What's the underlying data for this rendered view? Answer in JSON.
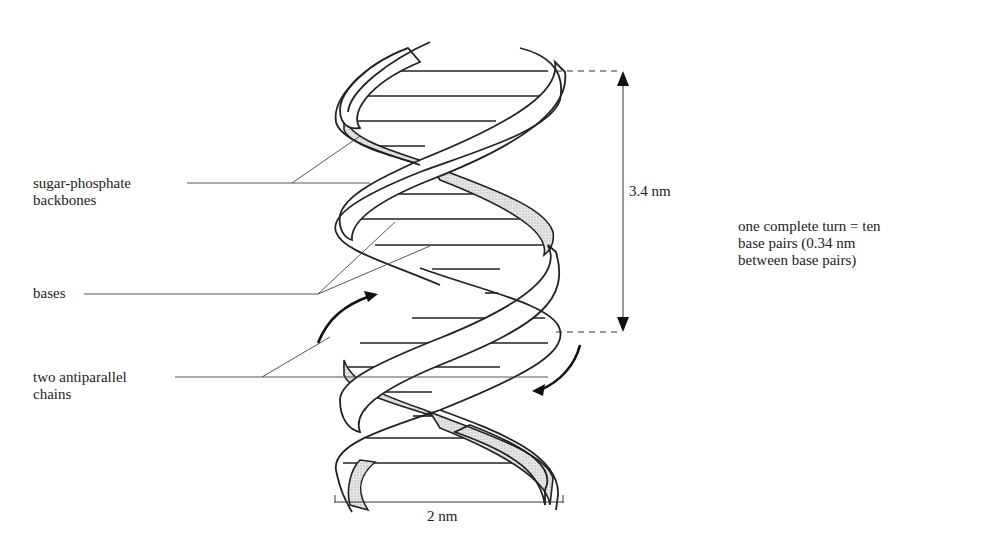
{
  "diagram": {
    "labels": {
      "backbones": "sugar-phosphate\nbackbones",
      "bases": "bases",
      "chains": "two antiparallel\nchains",
      "pitch": "3.4 nm",
      "turn_note": "one complete turn = ten\nbase pairs (0.34 nm\nbetween base pairs)",
      "width": "2 nm"
    },
    "measurements": {
      "helix_pitch_nm": 3.4,
      "helix_diameter_nm": 2,
      "base_pairs_per_turn": 10,
      "base_pair_spacing_nm": 0.34
    },
    "colors": {
      "line": "#222222",
      "stipple_fill": "#dcdcdc",
      "background": "#ffffff"
    }
  }
}
